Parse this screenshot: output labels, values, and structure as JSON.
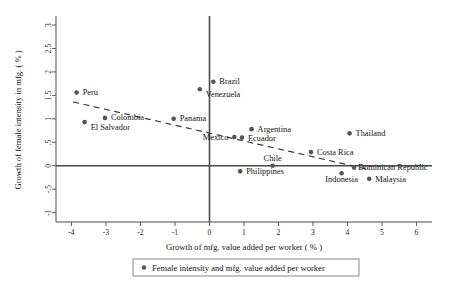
{
  "chart_data": {
    "type": "scatter",
    "title": "",
    "xlabel": "Growth of mfg. value added per worker ( % )",
    "ylabel": "Growth of female intensity in mfg. ( % )",
    "xlim": [
      -4.45,
      6.45
    ],
    "ylim": [
      -1.2,
      3.15
    ],
    "xticks": [
      -4,
      -3,
      -2,
      -1,
      0,
      1,
      2,
      3,
      4,
      5,
      6
    ],
    "xticklabels": [
      "-4",
      "-3",
      "-2",
      "-1",
      "0",
      "1",
      "2",
      "3",
      "4",
      "5",
      "6"
    ],
    "yticks": [
      -1,
      -0.5,
      0,
      0.5,
      1,
      1.5,
      2,
      2.5,
      3
    ],
    "yticklabels": [
      "-1",
      "-.5",
      "0",
      ".5",
      "1",
      "1.5",
      "2",
      "2.5",
      "3"
    ],
    "grid": false,
    "legend_position": "below-axis",
    "legend": [
      "Female intensity and mfg. value added per worker"
    ],
    "marker_color": "#55545a",
    "points": [
      {
        "label": "Peru",
        "x": -3.85,
        "y": 1.56,
        "label_dx": 6,
        "label_dy": 2.6,
        "anchor": "start"
      },
      {
        "label": "El Salvador",
        "x": -3.62,
        "y": 0.93,
        "label_dx": 6,
        "label_dy": 7.6,
        "anchor": "start"
      },
      {
        "label": "Colombia",
        "x": -3.03,
        "y": 1.02,
        "label_dx": 6,
        "label_dy": 2.6,
        "anchor": "start"
      },
      {
        "label": "Panama",
        "x": -1.04,
        "y": 1.0,
        "label_dx": 6,
        "label_dy": 2.6,
        "anchor": "start"
      },
      {
        "label": "Brazil",
        "x": 0.11,
        "y": 1.79,
        "label_dx": 6,
        "label_dy": 2.6,
        "anchor": "start"
      },
      {
        "label": "Venezuela",
        "x": -0.28,
        "y": 1.63,
        "label_dx": 6,
        "label_dy": 7.4,
        "anchor": "start"
      },
      {
        "label": "Mexico",
        "x": 0.72,
        "y": 0.61,
        "label_dx": -6,
        "label_dy": 2.6,
        "anchor": "end"
      },
      {
        "label": "Argentina",
        "x": 1.22,
        "y": 0.78,
        "label_dx": 6,
        "label_dy": 2.6,
        "anchor": "start"
      },
      {
        "label": "Ecuador",
        "x": 0.94,
        "y": 0.6,
        "label_dx": 6,
        "label_dy": 3.0,
        "anchor": "start"
      },
      {
        "label": "Costa Rica",
        "x": 2.94,
        "y": 0.29,
        "label_dx": 6,
        "label_dy": 2.6,
        "anchor": "start"
      },
      {
        "label": "Thailand",
        "x": 4.06,
        "y": 0.69,
        "label_dx": 6,
        "label_dy": 2.6,
        "anchor": "start"
      },
      {
        "label": "Chile",
        "x": 1.83,
        "y": 0.0,
        "label_dx": 0,
        "label_dy": -5.0,
        "anchor": "middle"
      },
      {
        "label": "Philippines",
        "x": 0.89,
        "y": -0.12,
        "label_dx": 6,
        "label_dy": 2.6,
        "anchor": "start"
      },
      {
        "label": "Dominican Republic",
        "x": 4.19,
        "y": -0.04,
        "label_dx": 4,
        "label_dy": 2.8,
        "anchor": "start"
      },
      {
        "label": "Indonesia",
        "x": 3.83,
        "y": -0.16,
        "label_dx": 0,
        "label_dy": 9.2,
        "anchor": "middle"
      },
      {
        "label": "Malaysia",
        "x": 4.63,
        "y": -0.28,
        "label_dx": 6,
        "label_dy": 2.8,
        "anchor": "start"
      }
    ],
    "fit_line": {
      "x_start": -3.95,
      "y_start": 1.36,
      "x_end": 4.55,
      "y_end": -0.07
    }
  }
}
